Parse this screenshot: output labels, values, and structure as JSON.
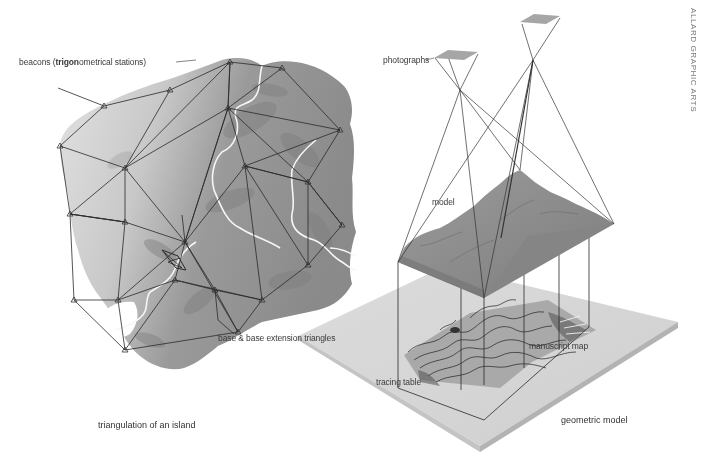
{
  "credit": "ALLARD GRAPHIC ARTS",
  "left_panel": {
    "caption": "triangulation of an island",
    "labels": {
      "beacons_prefix": "beacons (",
      "beacons_bold": "trigon",
      "beacons_suffix": "ometrical stations)",
      "base": "base & base extension triangles"
    }
  },
  "right_panel": {
    "caption": "geometric model",
    "labels": {
      "photographs": "photographs",
      "model": "model",
      "manuscript_map": "manuscript map",
      "tracing_table": "tracing table"
    }
  },
  "colors": {
    "island_light": "#d4d4d4",
    "island_dark": "#8c8c8c",
    "river": "#f4f4f4",
    "network_line": "#2a2a2a",
    "table_top": "#d6d6d6",
    "table_edge": "#b8b8b8",
    "model_surface": "#8f8f8f",
    "photo_plate": "#a8a8a8"
  }
}
